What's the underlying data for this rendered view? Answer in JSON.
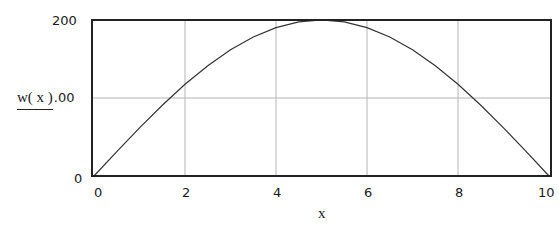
{
  "chart_data": {
    "type": "line",
    "title": "",
    "xlabel": "x",
    "ylabel": "w( x )",
    "xlim": [
      0,
      10
    ],
    "ylim": [
      0,
      200
    ],
    "grid": true,
    "legend": null,
    "x_ticks": [
      "0",
      "2",
      "4",
      "6",
      "8",
      "10"
    ],
    "y_ticks": [
      "0",
      "100",
      "200"
    ],
    "y_tick_visible_labels": [
      "0",
      ".00",
      "200"
    ],
    "series": [
      {
        "name": "w(x)",
        "x": [
          0,
          0.5,
          1,
          1.5,
          2,
          2.5,
          3,
          3.5,
          4,
          4.5,
          5,
          5.5,
          6,
          6.5,
          7,
          7.5,
          8,
          8.5,
          9,
          9.5,
          10
        ],
        "values": [
          0,
          31.3,
          61.8,
          90.8,
          117.6,
          141.4,
          161.8,
          178.2,
          190.2,
          197.5,
          200,
          197.5,
          190.2,
          178.2,
          161.8,
          141.4,
          117.6,
          90.8,
          61.8,
          31.3,
          0
        ]
      }
    ],
    "colors": {
      "frame": "#222222",
      "grid": "#b4b4b4",
      "line": "#333333",
      "background": "#ffffff"
    }
  },
  "labels": {
    "y_top": "200",
    "y_bottom": "0",
    "y_axis_expr": "w( x )",
    "y_axis_tail": ".00",
    "x_axis": "x",
    "x_ticks": [
      "0",
      "2",
      "4",
      "6",
      "8",
      "10"
    ]
  }
}
